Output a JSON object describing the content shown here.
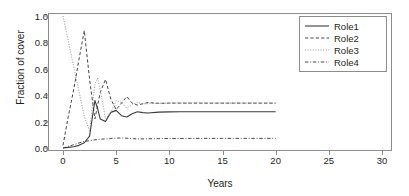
{
  "chart_data": {
    "type": "line",
    "title": "Markov chain",
    "xlabel": "Years",
    "ylabel": "Fraction of cover",
    "xlim": [
      0,
      30
    ],
    "ylim": [
      0,
      1.0
    ],
    "xticks": [
      0,
      5,
      10,
      15,
      20,
      25,
      30
    ],
    "xtick_labels": [
      "0",
      "5",
      "10",
      "15",
      "20",
      "25",
      "30"
    ],
    "yticks": [
      0.0,
      0.2,
      0.4,
      0.6,
      0.8,
      1.0
    ],
    "ytick_labels": [
      "0.0",
      "0.2",
      "0.4",
      "0.6",
      "0.8",
      "1.0"
    ],
    "grid": false,
    "legend_position": "top-right",
    "x": [
      0,
      0.5,
      1,
      1.5,
      2,
      2.5,
      3,
      3.25,
      3.5,
      4,
      4.5,
      5,
      5.5,
      6,
      6.5,
      7,
      7.5,
      8,
      9,
      10,
      11,
      12,
      13,
      14,
      15,
      16,
      17,
      18,
      19,
      20
    ],
    "series": [
      {
        "name": "Role1",
        "style": "solid",
        "color": "#3c3c3c",
        "values": [
          0.0,
          0.005,
          0.01,
          0.02,
          0.04,
          0.09,
          0.36,
          0.3,
          0.22,
          0.2,
          0.27,
          0.285,
          0.245,
          0.235,
          0.26,
          0.275,
          0.268,
          0.265,
          0.272,
          0.274,
          0.275,
          0.275,
          0.275,
          0.275,
          0.275,
          0.275,
          0.275,
          0.275,
          0.275,
          0.275
        ]
      },
      {
        "name": "Role2",
        "style": "dashed",
        "color": "#3c3c3c",
        "values": [
          0.02,
          0.24,
          0.44,
          0.67,
          0.89,
          0.52,
          0.22,
          0.32,
          0.42,
          0.52,
          0.37,
          0.29,
          0.34,
          0.39,
          0.34,
          0.325,
          0.335,
          0.345,
          0.338,
          0.34,
          0.34,
          0.34,
          0.34,
          0.34,
          0.34,
          0.34,
          0.34,
          0.34,
          0.34,
          0.34
        ]
      },
      {
        "name": "Role3",
        "style": "dotted",
        "color": "#8d8d8d",
        "values": [
          1.0,
          0.81,
          0.62,
          0.43,
          0.24,
          0.13,
          0.48,
          0.53,
          0.44,
          0.22,
          0.27,
          0.36,
          0.345,
          0.3,
          0.33,
          0.345,
          0.335,
          0.335,
          0.34,
          0.34,
          0.34,
          0.34,
          0.34,
          0.34,
          0.34,
          0.34,
          0.34,
          0.34,
          0.34,
          0.34
        ]
      },
      {
        "name": "Role4",
        "style": "dashdot",
        "color": "#3c3c3c",
        "values": [
          0.0,
          0.012,
          0.025,
          0.038,
          0.05,
          0.055,
          0.062,
          0.064,
          0.066,
          0.069,
          0.072,
          0.075,
          0.076,
          0.074,
          0.071,
          0.069,
          0.069,
          0.07,
          0.071,
          0.072,
          0.072,
          0.073,
          0.073,
          0.073,
          0.073,
          0.073,
          0.073,
          0.073,
          0.073,
          0.073
        ]
      }
    ]
  },
  "legend": {
    "entries": [
      {
        "label": "Role1"
      },
      {
        "label": "Role2"
      },
      {
        "label": "Role3"
      },
      {
        "label": "Role4"
      }
    ]
  }
}
